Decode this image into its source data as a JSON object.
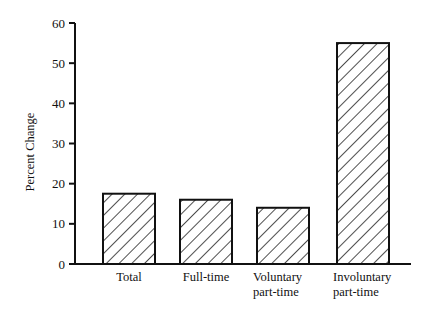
{
  "chart_data": {
    "type": "bar",
    "title": "",
    "xlabel": "",
    "ylabel": "Percent Change",
    "categories": [
      "Total",
      "Full-time",
      "Voluntary part-time",
      "Involuntary part-time"
    ],
    "category_lines": [
      [
        "Total"
      ],
      [
        "Full-time"
      ],
      [
        "Voluntary",
        "part-time"
      ],
      [
        "Involuntary",
        "part-time"
      ]
    ],
    "values": [
      17.5,
      16,
      14,
      55
    ],
    "ylim": [
      0,
      60
    ],
    "yticks": [
      0,
      10,
      20,
      30,
      40,
      50,
      60
    ],
    "grid": false,
    "legend": null,
    "bar_fill": "diagonal-hatch",
    "colors": {
      "bar_stroke": "#111111",
      "hatch": "#222222",
      "axis": "#111111",
      "background": "#ffffff"
    }
  }
}
